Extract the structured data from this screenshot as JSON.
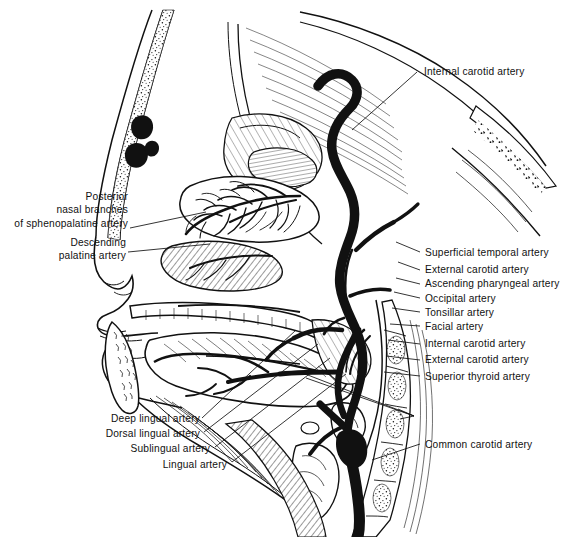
{
  "figure": {
    "title_semantic": "sagittal-section-head-neck-arterial-supply",
    "view": "Midsagittal section of head and neck showing arterial supply",
    "style": "black-and-white pen-and-ink medical illustration",
    "ink_color": "#111111",
    "background_color": "#ffffff"
  },
  "labels": {
    "internal_carotid_top": "Internal carotid artery",
    "posterior_nasal_branches": "Posterior\nnasal branches\nof sphenopalatine artery",
    "posterior_nasal_branches_line1": "Posterior",
    "posterior_nasal_branches_line2": "nasal branches",
    "posterior_nasal_branches_line3": "of sphenopalatine artery",
    "descending_palatine_line1": "Descending",
    "descending_palatine_line2": "palatine artery",
    "superficial_temporal": "Superficial temporal artery",
    "external_carotid_1": "External carotid artery",
    "ascending_pharyngeal": "Ascending pharyngeal artery",
    "occipital": "Occipital artery",
    "tonsillar": "Tonsillar artery",
    "facial": "Facial artery",
    "internal_carotid_2": "Internal carotid artery",
    "external_carotid_2": "External carotid artery",
    "superior_thyroid": "Superior thyroid artery",
    "common_carotid": "Common carotid artery",
    "deep_lingual": "Deep lingual artery",
    "dorsal_lingual": "Dorsal lingual artery",
    "sublingual": "Sublingual artery",
    "lingual": "Lingual artery"
  },
  "label_groups": {
    "right_upper": [
      "Internal carotid artery"
    ],
    "right_middle": [
      "Superficial temporal artery",
      "External carotid artery",
      "Ascending pharyngeal artery",
      "Occipital artery",
      "Tonsillar artery",
      "Facial artery",
      "Internal carotid artery",
      "External carotid artery",
      "Superior thyroid artery"
    ],
    "right_lower": [
      "Common carotid artery"
    ],
    "left_upper": [
      "Posterior nasal branches of sphenopalatine artery",
      "Descending palatine artery"
    ],
    "bottom_left": [
      "Deep lingual artery",
      "Dorsal lingual artery",
      "Sublingual artery",
      "Lingual artery"
    ]
  }
}
